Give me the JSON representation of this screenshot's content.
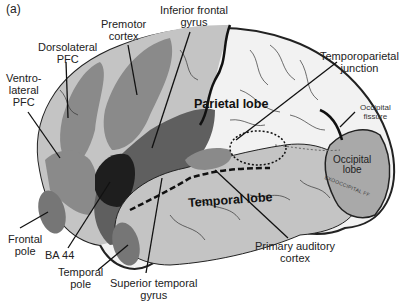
{
  "figure": {
    "panel_label": "(a)",
    "colors": {
      "background": "#ffffff",
      "brain_light": "#f2f2f2",
      "brain_mid": "#c4c4c4",
      "frontal_region": "#8a8a8a",
      "dark_region": "#5f5f5f",
      "ba44": "#1e1e1e",
      "occipital": "#a9a9a9",
      "temporal_pole": "#767676",
      "outline": "#222222"
    }
  },
  "lobes": {
    "parietal": "Parietal lobe",
    "temporal": "Temporal lobe",
    "occipital_line1": "Occipital",
    "occipital_line2": "lobe",
    "exooccipital": "EXOOCCIPITAL FF"
  },
  "labels": {
    "dorsolateral_pfc": [
      "Dorsolateral",
      "PFC"
    ],
    "ventrolateral_pfc": [
      "Ventro-",
      "lateral",
      "PFC"
    ],
    "premotor_cortex": [
      "Premotor",
      "cortex"
    ],
    "inferior_frontal_gyrus": [
      "Inferior frontal",
      "gyrus"
    ],
    "temporoparietal_junction": [
      "Temporoparietal",
      "junction"
    ],
    "occipital_fissure": [
      "Occipital",
      "fissure"
    ],
    "frontal_pole": [
      "Frontal",
      "pole"
    ],
    "ba44": [
      "BA 44"
    ],
    "temporal_pole": [
      "Temporal",
      "pole"
    ],
    "superior_temporal_gyrus": [
      "Superior temporal",
      "gyrus"
    ],
    "primary_auditory_cortex": [
      "Primary auditory",
      "cortex"
    ]
  }
}
